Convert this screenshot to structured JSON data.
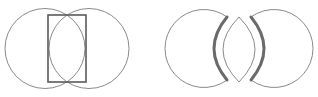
{
  "diagram": {
    "colors": {
      "background": "#ffffff",
      "thin_stroke": "#8a8a8a",
      "rect_stroke": "#5a5a5a",
      "thick_stroke": "#6a6a6a"
    },
    "figures": [
      {
        "id": "overlapping-circles-with-rectangle",
        "shapes": [
          "left circle",
          "right circle",
          "rectangle spanning intersection points"
        ]
      },
      {
        "id": "separated-crescents-and-lens",
        "shapes": [
          "left crescent",
          "central lens",
          "right crescent",
          "thick cut arcs"
        ]
      }
    ]
  }
}
